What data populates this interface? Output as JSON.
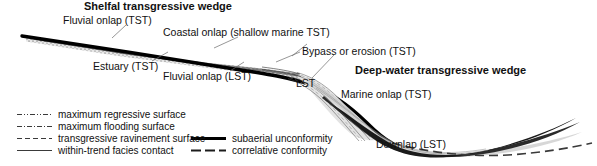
{
  "figure": {
    "type": "sequence-stratigraphic-cross-section",
    "titles": {
      "shelf_wedge": "Shelfal transgressive wedge",
      "deep_wedge": "Deep-water transgressive wedge"
    },
    "annotations": [
      {
        "id": "fluvial-onlap-tst",
        "text": "Fluvial onlap (TST)",
        "x": 63,
        "y": 16,
        "bold": false
      },
      {
        "id": "coastal-onlap-tst",
        "text": "Coastal onlap (shallow marine TST)",
        "x": 163,
        "y": 28,
        "bold": false
      },
      {
        "id": "estuary-tst",
        "text": "Estuary (TST)",
        "x": 93,
        "y": 62,
        "bold": false
      },
      {
        "id": "fluvial-onlap-lst",
        "text": "Fluvial onlap (LST)",
        "x": 163,
        "y": 72,
        "bold": false
      },
      {
        "id": "bypass-or-erosion",
        "text": "Bypass or erosion (TST)",
        "x": 302,
        "y": 47,
        "bold": false
      },
      {
        "id": "lst",
        "text": "LST",
        "x": 296,
        "y": 79,
        "bold": false
      },
      {
        "id": "marine-onlap-tst",
        "text": "Marine onlap (TST)",
        "x": 341,
        "y": 90,
        "bold": false
      },
      {
        "id": "downlap-lst",
        "text": "Downlap (LST)",
        "x": 376,
        "y": 140,
        "bold": false
      }
    ],
    "wedge_titles": [
      {
        "id": "shelfal-transgressive-wedge",
        "text": "Shelfal transgressive wedge",
        "x": 84,
        "y": 2
      },
      {
        "id": "deep-water-transgressive-wedge",
        "text": "Deep-water transgressive wedge",
        "x": 355,
        "y": 66
      }
    ]
  },
  "legend": {
    "column_left": [
      {
        "id": "maximum-regressive-surface",
        "label": "maximum regressive surface",
        "style": "dash-dot-dot-thin"
      },
      {
        "id": "maximum-flooding-surface",
        "label": "maximum flooding surface",
        "style": "dash-dot-thin"
      },
      {
        "id": "transgressive-ravinement-surface",
        "label": "transgressive ravinement surface",
        "style": "dashed-thin"
      },
      {
        "id": "within-trend-facies-contact",
        "label": "within-trend facies contact",
        "style": "solid-thin"
      }
    ],
    "column_right": [
      {
        "id": "subaerial-unconformity",
        "label": "subaerial unconformity",
        "style": "solid-thick"
      },
      {
        "id": "correlative-conformity",
        "label": "correlative conformity",
        "style": "dashed-medium"
      }
    ]
  },
  "colors": {
    "ink": "#111111",
    "subaerial_unconformity": "#000000",
    "deep_water_wedge_fill": "#2b2b2b",
    "shelf_wedge_fill": "#b8b8b8",
    "lst_wedge_fill": "#dcdcdc",
    "leader_line": "#555555",
    "background": "#ffffff"
  }
}
